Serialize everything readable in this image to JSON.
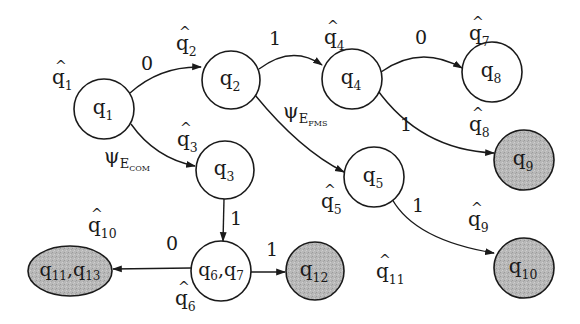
{
  "colors": {
    "stroke": "#1a1a1a",
    "accepting_fill": "#b8b8b8",
    "normal_fill": "#ffffff",
    "background": "#ffffff"
  },
  "nodes": [
    {
      "id": "q1",
      "base": "q",
      "sub": "1",
      "shape": "circle",
      "cx": 104,
      "cy": 109,
      "r": 30,
      "accepting": false
    },
    {
      "id": "q2",
      "base": "q",
      "sub": "2",
      "shape": "circle",
      "cx": 231,
      "cy": 80,
      "r": 29,
      "accepting": false
    },
    {
      "id": "q3",
      "base": "q",
      "sub": "3",
      "shape": "circle",
      "cx": 225,
      "cy": 170,
      "r": 29,
      "accepting": false
    },
    {
      "id": "q4",
      "base": "q",
      "sub": "4",
      "shape": "circle",
      "cx": 352,
      "cy": 79,
      "r": 30,
      "accepting": false
    },
    {
      "id": "q5",
      "base": "q",
      "sub": "5",
      "shape": "circle",
      "cx": 374,
      "cy": 177,
      "r": 30,
      "accepting": false
    },
    {
      "id": "q8",
      "base": "q",
      "sub": "8",
      "shape": "circle",
      "cx": 492,
      "cy": 72,
      "r": 30,
      "accepting": false
    },
    {
      "id": "q9",
      "base": "q",
      "sub": "9",
      "shape": "circle",
      "cx": 524,
      "cy": 160,
      "r": 30,
      "accepting": true
    },
    {
      "id": "q10",
      "base": "q",
      "sub": "10",
      "shape": "circle",
      "cx": 524,
      "cy": 268,
      "r": 30,
      "accepting": true
    },
    {
      "id": "q6q7",
      "label": "q6,q7",
      "parts": [
        {
          "base": "q",
          "sub": "6"
        },
        {
          "base": "q",
          "sub": "7"
        }
      ],
      "shape": "circle",
      "cx": 221,
      "cy": 271,
      "r": 30,
      "accepting": false
    },
    {
      "id": "q12",
      "base": "q",
      "sub": "12",
      "shape": "circle",
      "cx": 315,
      "cy": 271,
      "r": 29,
      "accepting": true
    },
    {
      "id": "q11q13",
      "label": "q11,q13",
      "parts": [
        {
          "base": "q",
          "sub": "11"
        },
        {
          "base": "q",
          "sub": "13"
        }
      ],
      "shape": "ellipse",
      "cx": 70,
      "cy": 271,
      "rx": 42,
      "ry": 25,
      "accepting": true
    }
  ],
  "edges": [
    {
      "from": "q1",
      "to": "q2",
      "label": "0",
      "path": "M 130 93 Q 160 66 201 67",
      "label_x": 147,
      "label_y": 70
    },
    {
      "from": "q1",
      "to": "q3",
      "label": "ψ",
      "label_sub": "E",
      "label_subsub": "COM",
      "path": "M 131 124 Q 155 158 195 166",
      "label_x": 104,
      "label_y": 163
    },
    {
      "from": "q2",
      "to": "q4",
      "label": "1",
      "path": "M 259 69 Q 292 44 322 65",
      "label_x": 275,
      "label_y": 45
    },
    {
      "from": "q2",
      "to": "q5",
      "label": "ψ",
      "label_sub": "E",
      "label_subsub": "FMS",
      "path": "M 255 95 Q 300 150 344 172",
      "label_x": 283,
      "label_y": 118
    },
    {
      "from": "q4",
      "to": "q8",
      "label": "0",
      "path": "M 381 72 Q 420 44 462 68",
      "label_x": 421,
      "label_y": 44
    },
    {
      "from": "q4",
      "to": "q9",
      "label": "1",
      "path": "M 376 88 Q 420 150 494 153",
      "label_x": 406,
      "label_y": 131
    },
    {
      "from": "q5",
      "to": "q10",
      "label": "1",
      "path": "M 392 199 Q 415 240 494 253",
      "label_x": 418,
      "label_y": 212
    },
    {
      "from": "q3",
      "to": "q6q7",
      "label": "1",
      "path": "M 224 199 L 223 241",
      "label_x": 236,
      "label_y": 225
    },
    {
      "from": "q6q7",
      "to": "q11q13",
      "label": "0",
      "path": "M 191 268 L 113 269",
      "label_x": 172,
      "label_y": 250
    },
    {
      "from": "q6q7",
      "to": "q12",
      "label": "1",
      "path": "M 251 272 L 285 272",
      "label_x": 272,
      "label_y": 256
    }
  ],
  "hat_labels": [
    {
      "id": "qhat1",
      "base": "q",
      "sub": "1",
      "x": 52,
      "y": 84
    },
    {
      "id": "qhat2",
      "base": "q",
      "sub": "2",
      "x": 176,
      "y": 50
    },
    {
      "id": "qhat3",
      "base": "q",
      "sub": "3",
      "x": 177,
      "y": 146
    },
    {
      "id": "qhat4",
      "base": "q",
      "sub": "4",
      "x": 324,
      "y": 44
    },
    {
      "id": "qhat5",
      "base": "q",
      "sub": "5",
      "x": 321,
      "y": 208
    },
    {
      "id": "qhat6",
      "base": "q",
      "sub": "6",
      "x": 175,
      "y": 305
    },
    {
      "id": "qhat7",
      "base": "q",
      "sub": "7",
      "x": 469,
      "y": 40
    },
    {
      "id": "qhat8",
      "base": "q",
      "sub": "8",
      "x": 469,
      "y": 131
    },
    {
      "id": "qhat9",
      "base": "q",
      "sub": "9",
      "x": 468,
      "y": 226
    },
    {
      "id": "qhat10",
      "base": "q",
      "sub": "10",
      "x": 88,
      "y": 232
    },
    {
      "id": "qhat11",
      "base": "q",
      "sub": "11",
      "x": 376,
      "y": 278
    }
  ]
}
